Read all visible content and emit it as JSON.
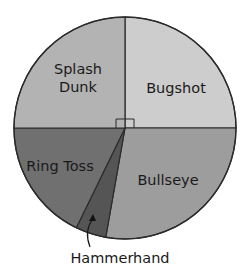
{
  "chart_data": {
    "type": "pie",
    "title": "",
    "start_angle_deg": 0,
    "direction": "clockwise",
    "units": "percent",
    "slices": [
      {
        "label": "Bugshot",
        "label_lines": [
          "Bugshot"
        ],
        "value": 25.0,
        "start_deg": 0,
        "end_deg": 90,
        "color": "#cdcdcd",
        "label_pos": [
          176,
          88
        ],
        "right_angle_marker": true
      },
      {
        "label": "Bullseye",
        "label_lines": [
          "Bullseye"
        ],
        "value": 27.8,
        "start_deg": 90,
        "end_deg": 190,
        "color": "#9d9d9d",
        "label_pos": [
          168,
          180
        ]
      },
      {
        "label": "Hammerhand",
        "label_lines": [],
        "value": 4.4,
        "start_deg": 190,
        "end_deg": 206,
        "color": "#555555",
        "callout": {
          "text": "Hammerhand",
          "text_pos": [
            120,
            263
          ],
          "arrow_from": [
            90,
            247
          ],
          "arrow_to": [
            92,
            216
          ]
        }
      },
      {
        "label": "Ring Toss",
        "label_lines": [
          "Ring Toss"
        ],
        "value": 17.8,
        "start_deg": 206,
        "end_deg": 270,
        "color": "#707070",
        "label_pos": [
          60,
          166
        ]
      },
      {
        "label": "Splash Dunk",
        "label_lines": [
          "Splash",
          "Dunk"
        ],
        "value": 25.0,
        "start_deg": 270,
        "end_deg": 360,
        "color": "#b3b3b3",
        "label_pos": [
          78,
          78
        ],
        "right_angle_marker": true
      }
    ],
    "center": [
      125,
      128
    ],
    "radius": 111,
    "stroke_color": "#2b2b2b",
    "legend": "none"
  }
}
